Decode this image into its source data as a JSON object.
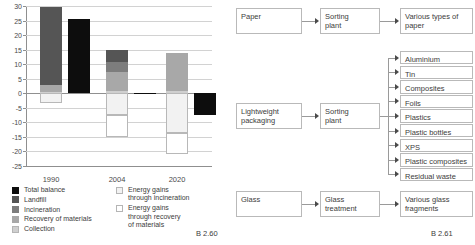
{
  "figure_left_ref": "B 2.60",
  "figure_right_ref": "B 2.61",
  "chart_data": {
    "type": "bar",
    "title": "",
    "xlabel": "",
    "ylabel": "",
    "ylim": [
      -25,
      30
    ],
    "grid": true,
    "stacked": true,
    "categories": [
      "1990",
      "2004",
      "2020"
    ],
    "yticks": [
      "30",
      "25",
      "20",
      "15",
      "10",
      "5",
      "0",
      "-5",
      "-10",
      "-15",
      "-20",
      "-25"
    ],
    "ytick_values": [
      30,
      25,
      20,
      15,
      10,
      5,
      0,
      -5,
      -10,
      -15,
      -20,
      -25
    ],
    "legend_position": "below-plot",
    "series": [
      {
        "name": "Total balance",
        "color": "#0d0d0d",
        "values": [
          25.6,
          -0.3,
          -7.5
        ]
      },
      {
        "name": "Landfill",
        "color": "#555555",
        "values": [
          27.0,
          4.1,
          0.0
        ]
      },
      {
        "name": "Incineration",
        "color": "#7d7d7d",
        "values": [
          0.0,
          3.5,
          0.0
        ]
      },
      {
        "name": "Recovery of materials",
        "color": "#a8a8a8",
        "values": [
          2.2,
          6.6,
          12.9
        ]
      },
      {
        "name": "Collection",
        "color": "#cfcfcf",
        "values": [
          0.5,
          0.8,
          0.9
        ]
      },
      {
        "name": "Energy gains through incineration",
        "color": "#f2f2f2",
        "values": [
          -3.3,
          -7.6,
          -14.3
        ]
      },
      {
        "name": "Energy gains through recovery of materials",
        "color": "#ffffff",
        "values": [
          0.0,
          -7.4,
          -7.3
        ]
      }
    ],
    "bars": [
      {
        "category": "1990",
        "stack_label": "balance-components",
        "positive_segments": [
          {
            "label": "Collection",
            "color": "#cfcfcf",
            "from": 0,
            "to": 0.5
          },
          {
            "label": "Recovery of materials",
            "color": "#a8a8a8",
            "from": 0.5,
            "to": 2.7
          },
          {
            "label": "Landfill",
            "color": "#555555",
            "from": 2.7,
            "to": 29.5
          }
        ],
        "negative_segments": [
          {
            "label": "Energy gains through incineration",
            "color": "#f2f2f2",
            "from": 0,
            "to": -3.3
          }
        ],
        "total_balance": 25.6
      },
      {
        "category": "2004",
        "stack_label": "balance-components",
        "positive_segments": [
          {
            "label": "Collection",
            "color": "#cfcfcf",
            "from": 0,
            "to": 0.8
          },
          {
            "label": "Recovery of materials",
            "color": "#a8a8a8",
            "from": 0.8,
            "to": 7.4
          },
          {
            "label": "Incineration",
            "color": "#7d7d7d",
            "from": 7.4,
            "to": 10.9
          },
          {
            "label": "Landfill",
            "color": "#555555",
            "from": 10.9,
            "to": 14.9
          }
        ],
        "negative_segments": [
          {
            "label": "Energy gains through incineration",
            "color": "#f2f2f2",
            "from": 0,
            "to": -7.6
          },
          {
            "label": "Energy gains through recovery of materials",
            "color": "#ffffff",
            "from": -7.6,
            "to": -15.0
          }
        ],
        "total_balance": -0.3
      },
      {
        "category": "2020",
        "stack_label": "balance-components",
        "positive_segments": [
          {
            "label": "Collection",
            "color": "#cfcfcf",
            "from": 0,
            "to": 0.9
          },
          {
            "label": "Recovery of materials",
            "color": "#a8a8a8",
            "from": 0.9,
            "to": 13.8
          }
        ],
        "negative_segments": [
          {
            "label": "Energy gains through incineration",
            "color": "#f2f2f2",
            "from": 0,
            "to": -13.5
          },
          {
            "label": "Energy gains through recovery of materials",
            "color": "#ffffff",
            "from": -13.5,
            "to": -20.8
          }
        ],
        "total_balance": -7.5
      }
    ],
    "legend_left": [
      {
        "label": "Total balance",
        "color": "#0d0d0d",
        "border": "#0d0d0d"
      },
      {
        "label": "Landfill",
        "color": "#555555",
        "border": "#555555"
      },
      {
        "label": "Incineration",
        "color": "#7d7d7d",
        "border": "#7d7d7d"
      },
      {
        "label": "Recovery of materials",
        "color": "#a8a8a8",
        "border": "#a8a8a8"
      },
      {
        "label": "Collection",
        "color": "#cfcfcf",
        "border": "#b5b5b5"
      }
    ],
    "legend_right": [
      {
        "label": "Energy gains\nthrough incineration",
        "color": "#f2f2f2",
        "border": "#b5b5b5"
      },
      {
        "label": "Energy gains\nthrough recovery\nof materials",
        "color": "#ffffff",
        "border": "#b5b5b5"
      }
    ]
  },
  "flow": {
    "rows": [
      {
        "id": "paper",
        "input": "Paper",
        "process": "Sorting\nplant",
        "outputs": [
          "Various types of\npaper"
        ]
      },
      {
        "id": "lightweight-packaging",
        "input": "Lightweight\npackaging",
        "process": "Sorting\nplant",
        "outputs": [
          "Aluminium",
          "Tin",
          "Composites",
          "Foils",
          "Plastics",
          "Plastic bottles",
          "XPS",
          "Plastic composites",
          "Residual waste"
        ]
      },
      {
        "id": "glass",
        "input": "Glass",
        "process": "Glass\ntreatment",
        "outputs": [
          "Various glass\nfragments"
        ]
      }
    ]
  }
}
